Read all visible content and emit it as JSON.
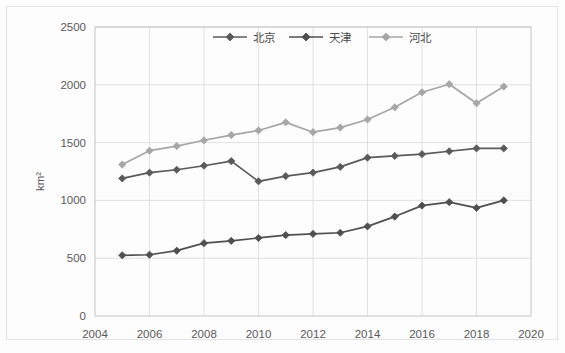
{
  "chart_data": {
    "type": "line",
    "title": "",
    "subtitle": "",
    "xlabel": "",
    "ylabel": "km²",
    "x": [
      2005,
      2006,
      2007,
      2008,
      2009,
      2010,
      2011,
      2012,
      2013,
      2014,
      2015,
      2016,
      2017,
      2018,
      2019
    ],
    "xlim": [
      2004,
      2020
    ],
    "ylim": [
      0,
      2500
    ],
    "x_ticks": [
      "2004",
      "2006",
      "2008",
      "2010",
      "2012",
      "2014",
      "2016",
      "2018",
      "2020"
    ],
    "x_tick_values": [
      2004,
      2006,
      2008,
      2010,
      2012,
      2014,
      2016,
      2018,
      2020
    ],
    "y_ticks": [
      "0",
      "500",
      "1000",
      "1500",
      "2000",
      "2500"
    ],
    "y_tick_values": [
      0,
      500,
      1000,
      1500,
      2000,
      2500
    ],
    "grid": "horizontal-and-vertical",
    "legend_position": "top-center",
    "marker": "diamond",
    "series": [
      {
        "name": "北京",
        "color": "#5a5a5a",
        "values": [
          1190,
          1240,
          1265,
          1300,
          1340,
          1165,
          1210,
          1240,
          1290,
          1370,
          1385,
          1400,
          1425,
          1450,
          1450
        ]
      },
      {
        "name": "天津",
        "color": "#4f4f4f",
        "values": [
          525,
          530,
          565,
          630,
          650,
          675,
          700,
          710,
          720,
          775,
          860,
          955,
          985,
          935,
          1000
        ]
      },
      {
        "name": "河北",
        "color": "#a6a6a6",
        "values": [
          1310,
          1430,
          1470,
          1520,
          1565,
          1605,
          1675,
          1590,
          1630,
          1700,
          1805,
          1935,
          2005,
          1840,
          1985
        ]
      }
    ]
  },
  "axis": {
    "y_title": "km²"
  },
  "legend": {
    "items": [
      {
        "label": "北京"
      },
      {
        "label": "天津"
      },
      {
        "label": "河北"
      }
    ]
  },
  "colors": {
    "beijing": "#5a5a5a",
    "tianjin": "#4f4f4f",
    "hebei": "#a6a6a6",
    "grid": "#d9d9d9",
    "axis_text": "#595959",
    "plot_border": "#bfbfbf",
    "background": "#fdfdfd"
  }
}
